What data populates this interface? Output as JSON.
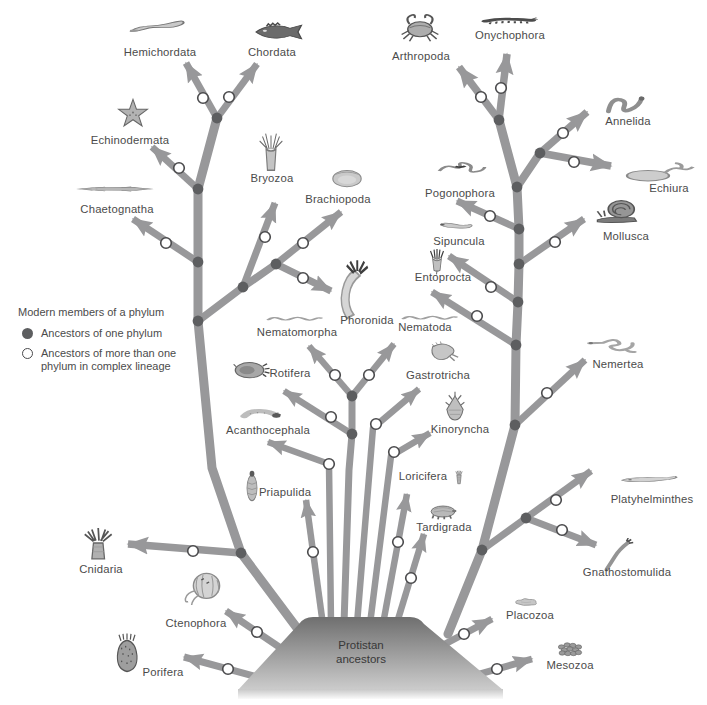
{
  "legend": {
    "title": "Modern members of a phylum",
    "items": [
      {
        "marker": "filled-circle",
        "label": "Ancestors of one phylum"
      },
      {
        "marker": "open-circle",
        "label": "Ancestors of more than one phylum in complex lineage"
      }
    ]
  },
  "root": {
    "lines": [
      "Protistan",
      "ancestors"
    ]
  },
  "colors": {
    "branch": "#98989a",
    "node": "#5d5e60",
    "circle_fill": "#ffffff",
    "circle_stroke": "#4a4a4c",
    "mound_top": "#747474",
    "mound_bottom": "#cccccc",
    "label": "#4b4b4b"
  },
  "phyla": [
    {
      "id": "hemichordata",
      "label": "Hemichordata",
      "icon": "acorn-worm-icon"
    },
    {
      "id": "chordata",
      "label": "Chordata",
      "icon": "fish-icon"
    },
    {
      "id": "echinodermata",
      "label": "Echinodermata",
      "icon": "starfish-icon"
    },
    {
      "id": "chaetognatha",
      "label": "Chaetognatha",
      "icon": "arrow-worm-icon"
    },
    {
      "id": "bryozoa",
      "label": "Bryozoa",
      "icon": "moss-animal-icon"
    },
    {
      "id": "brachiopoda",
      "label": "Brachiopoda",
      "icon": "lamp-shell-icon"
    },
    {
      "id": "phoronida",
      "label": "Phoronida",
      "icon": "horseshoe-worm-icon"
    },
    {
      "id": "arthropoda",
      "label": "Arthropoda",
      "icon": "crab-icon"
    },
    {
      "id": "onychophora",
      "label": "Onychophora",
      "icon": "velvet-worm-icon"
    },
    {
      "id": "annelida",
      "label": "Annelida",
      "icon": "segmented-worm-icon"
    },
    {
      "id": "echiura",
      "label": "Echiura",
      "icon": "spoon-worm-icon"
    },
    {
      "id": "mollusca",
      "label": "Mollusca",
      "icon": "snail-icon"
    },
    {
      "id": "pogonophora",
      "label": "Pogonophora",
      "icon": "beard-worm-icon"
    },
    {
      "id": "sipuncula",
      "label": "Sipuncula",
      "icon": "peanut-worm-icon"
    },
    {
      "id": "entoprocta",
      "label": "Entoprocta",
      "icon": "goblet-animal-icon"
    },
    {
      "id": "nematoda",
      "label": "Nematoda",
      "icon": "roundworm-icon"
    },
    {
      "id": "nematomorpha",
      "label": "Nematomorpha",
      "icon": "horsehair-worm-icon"
    },
    {
      "id": "rotifera",
      "label": "Rotifera",
      "icon": "rotifer-icon"
    },
    {
      "id": "gastrotricha",
      "label": "Gastrotricha",
      "icon": "gastrotrich-icon"
    },
    {
      "id": "acanthocephala",
      "label": "Acanthocephala",
      "icon": "spiny-headed-worm-icon"
    },
    {
      "id": "kinoryncha",
      "label": "Kinoryncha",
      "icon": "kinorhynch-icon"
    },
    {
      "id": "nemertea",
      "label": "Nemertea",
      "icon": "ribbon-worm-icon"
    },
    {
      "id": "priapulida",
      "label": "Priapulida",
      "icon": "priapulid-icon"
    },
    {
      "id": "loricifera",
      "label": "Loricifera",
      "icon": "loriciferan-icon"
    },
    {
      "id": "tardigrada",
      "label": "Tardigrada",
      "icon": "water-bear-icon"
    },
    {
      "id": "platyhelminthes",
      "label": "Platyhelminthes",
      "icon": "flatworm-icon"
    },
    {
      "id": "gnathostomulida",
      "label": "Gnathostomulida",
      "icon": "jaw-worm-icon"
    },
    {
      "id": "cnidaria",
      "label": "Cnidaria",
      "icon": "sea-anemone-icon"
    },
    {
      "id": "ctenophora",
      "label": "Ctenophora",
      "icon": "comb-jelly-icon"
    },
    {
      "id": "porifera",
      "label": "Porifera",
      "icon": "sponge-icon"
    },
    {
      "id": "placozoa",
      "label": "Placozoa",
      "icon": "placozoan-icon"
    },
    {
      "id": "mesozoa",
      "label": "Mesozoa",
      "icon": "mesozoan-icon"
    }
  ]
}
